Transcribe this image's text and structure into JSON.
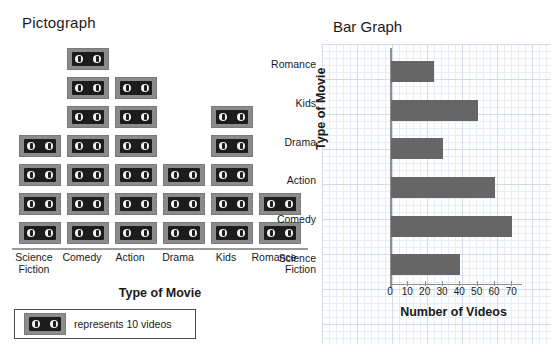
{
  "pictograph": {
    "title": "Pictograph",
    "xaxis_title": "Type of Movie",
    "categories": [
      "Science Fiction",
      "Comedy",
      "Action",
      "Drama",
      "Kids",
      "Romance"
    ],
    "icon_counts": [
      4,
      7,
      6,
      3,
      5,
      2
    ],
    "icon_name": "videotape-icon",
    "legend": {
      "text": "represents 10 videos",
      "icon_name": "videotape-icon"
    }
  },
  "bargraph": {
    "title": "Bar Graph",
    "yaxis_title": "Type of Movie",
    "xaxis_title": "Number of Videos"
  },
  "chart_data": [
    {
      "type": "pictograph",
      "title": "Pictograph",
      "xlabel": "Type of Movie",
      "ylabel": "",
      "categories": [
        "Science Fiction",
        "Comedy",
        "Action",
        "Drama",
        "Kids",
        "Romance"
      ],
      "icons": [
        4,
        7,
        6,
        3,
        5,
        2
      ],
      "icon_value": 10,
      "values": [
        40,
        70,
        60,
        30,
        50,
        20
      ],
      "legend": "represents 10 videos",
      "grid": false
    },
    {
      "type": "bar",
      "orientation": "horizontal",
      "title": "Bar Graph",
      "xlabel": "Number of Videos",
      "ylabel": "Type of Movie",
      "categories": [
        "Science Fiction",
        "Comedy",
        "Action",
        "Drama",
        "Kids",
        "Romance"
      ],
      "values": [
        40,
        70,
        60,
        30,
        50,
        25
      ],
      "xticks": [
        0,
        10,
        20,
        30,
        40,
        50,
        60,
        70
      ],
      "xlim": [
        0,
        75
      ],
      "bar_color": "#666666",
      "grid": true,
      "legend": null
    }
  ]
}
